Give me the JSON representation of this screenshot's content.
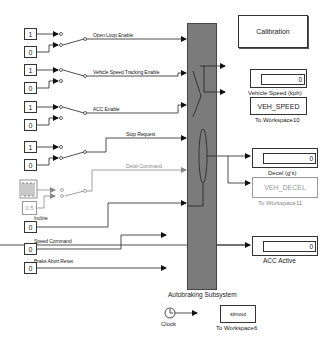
{
  "diagram": {
    "subsystem": {
      "label": "Autobraking Subsystem",
      "fill": "#7b7b7b"
    },
    "inputs": [
      {
        "signal": "Open Loop Enable",
        "const_top": "1",
        "const_bottom": "0"
      },
      {
        "signal": "Vehicle Speed Tracking Enable",
        "const_top": "1",
        "const_bottom": "0"
      },
      {
        "signal": "ACC Enable",
        "const_top": "1",
        "const_bottom": "0"
      },
      {
        "signal": "Stop Request",
        "const_top": "1",
        "const_bottom": "0"
      },
      {
        "signal": "Decel Command",
        "const_top": "pulse-generator",
        "const_bottom": "0.5"
      },
      {
        "signal": "Incline",
        "const": "0"
      },
      {
        "signal": "Speed Command",
        "const": "0"
      },
      {
        "signal": "Brake Abort Reset",
        "const": "0"
      }
    ],
    "outputs": {
      "calibration": {
        "label": "Calibration"
      },
      "vehicle_speed_display": {
        "value": "0",
        "label": "Vehicle Speed (kph)"
      },
      "veh_speed_workspace": {
        "variable": "VEH_SPEED",
        "label": "To Workspace10"
      },
      "decel_display": {
        "value": "0",
        "label": "Decel (g's)"
      },
      "veh_decel_workspace": {
        "variable": "VEH_DECEL",
        "label": "To Workspace11"
      },
      "acc_active_display": {
        "value": "0",
        "label": "ACC Active"
      }
    },
    "clock": {
      "label": "Clock"
    },
    "simout_workspace": {
      "variable": "simout",
      "label": "To Workspace6"
    }
  }
}
